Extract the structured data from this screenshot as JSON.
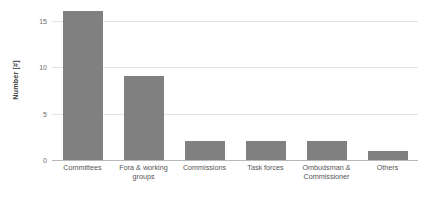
{
  "chart_data": {
    "type": "bar",
    "title": "",
    "subtitle": "",
    "xlabel": "",
    "ylabel": "Number [#]",
    "categories": [
      "Committees",
      "Fora & working groups",
      "Commissions",
      "Task forces",
      "Ombudsman & Commissioner",
      "Others"
    ],
    "values": [
      16,
      9,
      2,
      2,
      2,
      1
    ],
    "ylim": [
      0,
      16.8
    ],
    "yticks": [
      0,
      5,
      10,
      15
    ],
    "ytick_labels": [
      "0",
      "5",
      "10",
      "15"
    ],
    "grid": true,
    "legend": false,
    "legend_position": "none",
    "orientation": "vertical",
    "bar_color": "#808080",
    "gridline_color": "#e3e3e3",
    "axis_color": "#b8b8b8",
    "background_color": "#ffffff",
    "text_color": "#555555"
  }
}
